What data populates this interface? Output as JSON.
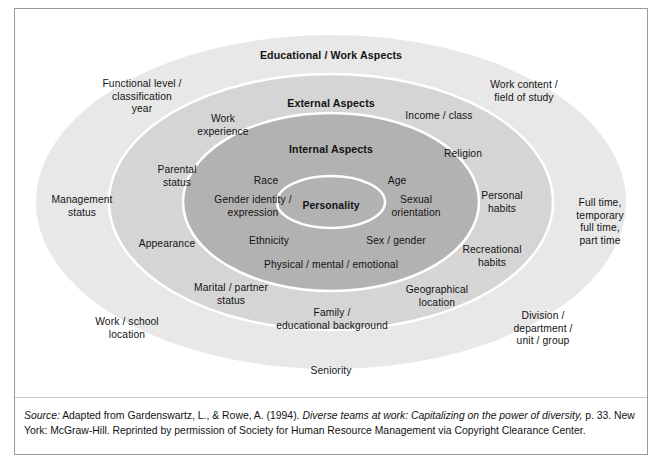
{
  "figure": {
    "type": "four-layer-diversity-wheel",
    "ring_titles": {
      "outer": "Educational / Work Aspects",
      "middle": "External Aspects",
      "inner": "Internal Aspects",
      "core": "Personality"
    },
    "colors": {
      "outer_ring": "#e8e8e8",
      "middle_ring": "#d4d4d4",
      "inner_ring": "#b2b2b2",
      "core_ellipse": "#b2b2b2",
      "core_stroke": "#ffffff",
      "ring_stroke": "#ffffff",
      "background": "#ffffff",
      "frame_border": "#9a9a9a",
      "text": "#131313"
    },
    "layers": [
      {
        "name": "Educational / Work Aspects",
        "level": 4,
        "items": [
          "Functional level /\nclassification\nyear",
          "Work content /\nfield of study",
          "Management\nstatus",
          "Full time,\ntemporary\nfull time,\npart time",
          "Work / school\nlocation",
          "Division /\ndepartment /\nunit / group",
          "Seniority"
        ]
      },
      {
        "name": "External Aspects",
        "level": 3,
        "items": [
          "Work\nexperience",
          "Income / class",
          "Parental\nstatus",
          "Religion",
          "Appearance",
          "Personal\nhabits",
          "Marital / partner\nstatus",
          "Recreational\nhabits",
          "Geographical\nlocation",
          "Family /\neducational background"
        ]
      },
      {
        "name": "Internal Aspects",
        "level": 2,
        "items": [
          "Race",
          "Age",
          "Gender identity /\nexpression",
          "Sexual\norientation",
          "Ethnicity",
          "Sex / gender",
          "Physical / mental / emotional"
        ]
      },
      {
        "name": "Personality",
        "level": 1,
        "items": []
      }
    ],
    "labels": {
      "outer_title": "Educational / Work Aspects",
      "middle_title": "External Aspects",
      "inner_title": "Internal Aspects",
      "core": "Personality",
      "functional_level": "Functional level /\nclassification\nyear",
      "work_content": "Work content /\nfield of study",
      "management_status": "Management\nstatus",
      "full_time": "Full time,\ntemporary\nfull time,\npart time",
      "work_school_location": "Work / school\nlocation",
      "division": "Division /\ndepartment /\nunit / group",
      "seniority": "Seniority",
      "work_experience": "Work\nexperience",
      "income_class": "Income / class",
      "parental_status": "Parental\nstatus",
      "religion": "Religion",
      "appearance": "Appearance",
      "personal_habits": "Personal\nhabits",
      "marital_partner": "Marital / partner\nstatus",
      "recreational_habits": "Recreational\nhabits",
      "geographical_location": "Geographical\nlocation",
      "family_educational": "Family /\neducational background",
      "race": "Race",
      "age": "Age",
      "gender_identity": "Gender identity /\nexpression",
      "sexual_orientation": "Sexual\norientation",
      "ethnicity": "Ethnicity",
      "sex_gender": "Sex / gender",
      "physical_mental_emotional": "Physical / mental / emotional"
    }
  },
  "source": {
    "label": "Source:",
    "part1": " Adapted from Gardenswartz, L., & Rowe, A. (1994). ",
    "title_italic": "Diverse teams at work: Capitalizing on the power of diversity,",
    "part2": " p. 33. New York: McGraw-Hill. Reprinted by permission of Society for Human Resource Management via Copyright Clearance Center."
  }
}
